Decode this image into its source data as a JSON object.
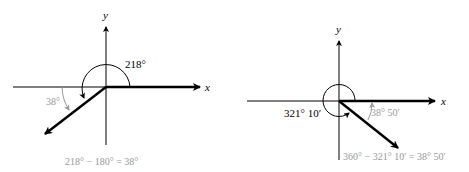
{
  "left_diagram": {
    "x_label": "x",
    "y_label": "y",
    "angle_label": "218°",
    "reference_label": "38°",
    "equation": "218° − 180° = 38°"
  },
  "right_diagram": {
    "x_label": "x",
    "y_label": "y",
    "angle_label": "321° 10′",
    "reference_label": "38° 50′",
    "equation": "360° − 321° 10′ = 38° 50′"
  },
  "colors": {
    "line": "#000000",
    "annotation": "#999999"
  }
}
